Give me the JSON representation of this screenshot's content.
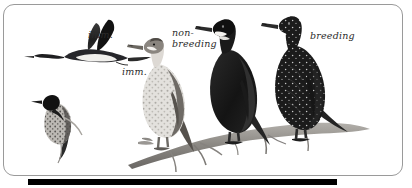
{
  "plate": {
    "kind": "field-guide-illustration",
    "subject": "cormorant",
    "background_color": "#ffffff",
    "border_color": "#9a9a9a",
    "bottom_bar_color": "#000000"
  },
  "labels": [
    {
      "id": "imm-flight",
      "text": "imm.",
      "refers_to": "flying immature bird, upper left"
    },
    {
      "id": "imm-perched",
      "text": "imm.",
      "refers_to": "perched immature on branch, left of trio"
    },
    {
      "id": "non-breeding",
      "text": "non-\nbreeding",
      "refers_to": "centre adult on branch"
    },
    {
      "id": "breeding",
      "text": "breeding",
      "refers_to": "right-hand adult on branch"
    }
  ],
  "figures": [
    {
      "id": "flying-immature",
      "pose": "in flight, wings raised",
      "plumage": "dark above, pale belly"
    },
    {
      "id": "perched-immature",
      "pose": "perched upright, lower left",
      "plumage": "dark head, mottled pale body"
    },
    {
      "id": "branch-immature",
      "pose": "standing on branch",
      "plumage": "pale whitish breast, brown-grey upperparts"
    },
    {
      "id": "branch-nonbreeding",
      "pose": "standing on branch",
      "plumage": "uniform blackish, pale throat patch"
    },
    {
      "id": "branch-breeding",
      "pose": "standing on branch",
      "plumage": "black with white filoplume speckles on head and neck"
    }
  ],
  "branch": {
    "id": "perch-branch",
    "description": "bare diagonal branch with side twigs",
    "color": "#8d8d8d"
  }
}
